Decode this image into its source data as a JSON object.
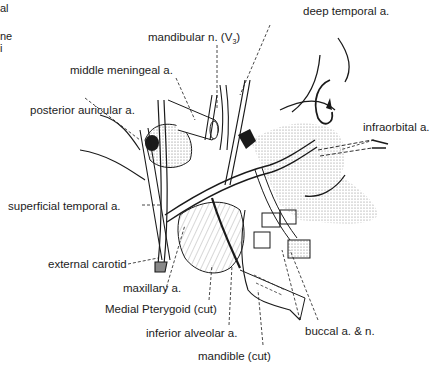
{
  "figure": {
    "edge_fragments": [
      "al",
      "ne",
      "i"
    ]
  },
  "labels": {
    "deep_temporal": "deep temporal a.",
    "mandibular_nerve": "mandibular n. (V",
    "mandibular_nerve_sub": "3",
    "mandibular_nerve_close": ")",
    "middle_meningeal": "middle meningeal a.",
    "posterior_auricular": "posterior auricular a.",
    "infraorbital": "infraorbital a.",
    "superficial_temporal": "superficial temporal a.",
    "external_carotid": "external carotid",
    "maxillary": "maxillary a.",
    "medial_pterygoid": "Medial Pterygoid (cut)",
    "inferior_alveolar": "inferior alveolar a.",
    "buccal": "buccal a. & n.",
    "mandible": "mandible (cut)"
  },
  "colors": {
    "ink": "#1a1a1a",
    "stipple": "#bdbdbd",
    "background": "#ffffff"
  }
}
